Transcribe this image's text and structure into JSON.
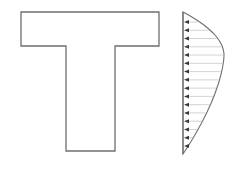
{
  "diagram": {
    "title": "",
    "colors": {
      "outline": "#6f6f6f",
      "arrow": "#3a3a3a",
      "hatch": "#c8c8c8",
      "background": "#ffffff"
    },
    "t_section": {
      "flange": {
        "left": 21,
        "right": 159,
        "top": 12,
        "bottom": 46
      },
      "web": {
        "left": 66,
        "right": 115,
        "bottom": 151
      }
    },
    "stress_distribution": {
      "baseline_x": 183,
      "top_y": 12,
      "bottom_y": 154,
      "max_x": 224,
      "max_y": 55,
      "arrow_count": 16,
      "arrow_direction": "left"
    }
  }
}
